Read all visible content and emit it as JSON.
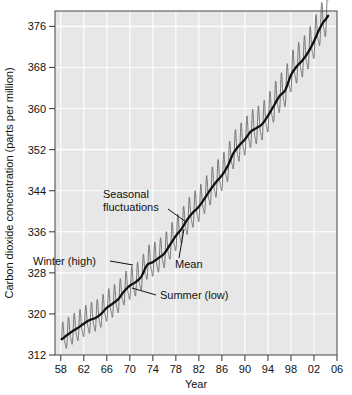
{
  "chart_data": {
    "type": "line",
    "title": "",
    "xlabel": "Year",
    "ylabel": "Carbon dioxide concentration (parts per million)",
    "xlim": [
      1957.0,
      2006.0
    ],
    "ylim": [
      312,
      379
    ],
    "xticks": [
      "58",
      "62",
      "66",
      "70",
      "74",
      "78",
      "82",
      "86",
      "90",
      "94",
      "98",
      "02",
      "06"
    ],
    "xtick_values": [
      1958,
      1962,
      1966,
      1970,
      1974,
      1978,
      1982,
      1986,
      1990,
      1994,
      1998,
      2002,
      2006
    ],
    "yticks": [
      "312",
      "320",
      "328",
      "336",
      "344",
      "352",
      "360",
      "368",
      "376"
    ],
    "ytick_values": [
      312,
      320,
      328,
      336,
      344,
      352,
      360,
      368,
      376
    ],
    "grid": true,
    "grid_color": "#ffffff",
    "plot_background": "#e7e7e7",
    "legend": "none",
    "series": [
      {
        "name": "Mean",
        "color": "#111111",
        "description": "Smoothed annual-mean trend of atmospheric carbon dioxide",
        "x": [
          1958,
          1959,
          1960,
          1961,
          1962,
          1963,
          1964,
          1965,
          1966,
          1967,
          1968,
          1969,
          1970,
          1971,
          1972,
          1973,
          1974,
          1975,
          1976,
          1977,
          1978,
          1979,
          1980,
          1981,
          1982,
          1983,
          1984,
          1985,
          1986,
          1987,
          1988,
          1989,
          1990,
          1991,
          1992,
          1993,
          1994,
          1995,
          1996,
          1997,
          1998,
          1999,
          2000,
          2001,
          2002,
          2003,
          2004
        ],
        "values": [
          315.0,
          315.8,
          316.6,
          317.3,
          318.1,
          318.8,
          319.2,
          320.0,
          321.2,
          322.0,
          322.9,
          324.4,
          325.5,
          326.2,
          327.3,
          329.5,
          330.1,
          330.9,
          331.8,
          333.5,
          335.2,
          336.6,
          338.4,
          339.8,
          340.9,
          342.5,
          344.2,
          345.7,
          347.0,
          348.8,
          351.3,
          352.8,
          354.0,
          355.5,
          356.2,
          357.0,
          358.6,
          360.5,
          362.4,
          363.6,
          366.5,
          368.2,
          369.4,
          371.0,
          373.1,
          375.6,
          377.3
        ]
      },
      {
        "name": "Seasonal fluctuations",
        "color": "#5d5d5d",
        "description": "Monthly record showing annual cycle: winter high, summer low",
        "amplitude_ppm": 6.0,
        "winter_peak_month": "May",
        "summer_trough_month": "October"
      }
    ],
    "annotations": [
      {
        "label": "Seasonal fluctuations",
        "target_year": 1980.5,
        "target_ppm": 339.0
      },
      {
        "label": "Mean",
        "target_year": 1979.0,
        "target_ppm": 337.0
      },
      {
        "label": "Winter (high)",
        "target_year": 1972.0,
        "target_ppm": 330.5
      },
      {
        "label": "Summer (low)",
        "target_year": 1971.5,
        "target_ppm": 324.5
      }
    ]
  },
  "labels": {
    "xlabel": "Year",
    "ylabel": "Carbon dioxide concentration (parts per million)",
    "annotation_seasonal_line1": "Seasonal",
    "annotation_seasonal_line2": "fluctuations",
    "annotation_mean": "Mean",
    "annotation_winter": "Winter (high)",
    "annotation_summer": "Summer (low)"
  }
}
